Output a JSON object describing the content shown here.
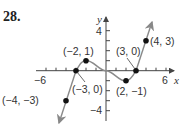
{
  "problem_number": "28.",
  "chart_data": {
    "type": "line",
    "title": "",
    "xlabel": "x",
    "ylabel": "y",
    "xlim": [
      -7,
      7
    ],
    "ylim": [
      -5,
      5
    ],
    "x_tick_labels": [
      "−6",
      "6"
    ],
    "y_tick_labels": [
      "4",
      "−4"
    ],
    "grid": false,
    "labeled_points": [
      {
        "x": -4,
        "y": -3,
        "label": "(−4, −3)"
      },
      {
        "x": -3,
        "y": 0,
        "label": "(−3, 0)"
      },
      {
        "x": -2,
        "y": 1,
        "label": "(−2, 1)"
      },
      {
        "x": 2,
        "y": -1,
        "label": "(2, −1)"
      },
      {
        "x": 3,
        "y": 0,
        "label": "(3, 0)"
      },
      {
        "x": 4,
        "y": 3,
        "label": "(4, 3)"
      }
    ],
    "series": [
      {
        "name": "left-ray",
        "x": [
          -4.7,
          -4,
          -3
        ],
        "y": [
          -5.2,
          -3,
          0
        ]
      },
      {
        "name": "middle-curve",
        "x": [
          -3,
          -2,
          0,
          2,
          3
        ],
        "y": [
          0,
          1,
          0,
          -1,
          0
        ]
      },
      {
        "name": "right-ray",
        "x": [
          3,
          4,
          4.6
        ],
        "y": [
          0,
          3,
          4.8
        ]
      }
    ]
  }
}
